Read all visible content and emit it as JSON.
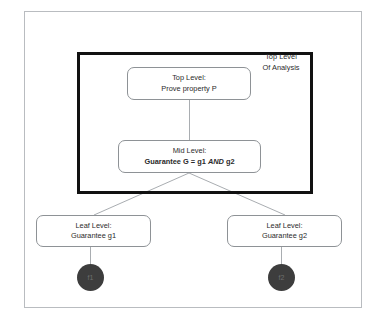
{
  "diagram": {
    "outer_frame": {
      "name": "assurance-case-outer-frame"
    },
    "inner_frame": {
      "caption_line1": "Top Level",
      "caption_line2": "Of Analysis"
    },
    "nodes": [
      {
        "id": "top",
        "line1": "Top Level:",
        "line2": "Prove property P"
      },
      {
        "id": "mid",
        "line1": "Mid Level:",
        "line2_prefix": "Guarantee G = g1 ",
        "line2_operator": "AND",
        "line2_suffix": " g2"
      },
      {
        "id": "leaf1",
        "line1": "Leaf Level:",
        "line2": "Guarantee g1"
      },
      {
        "id": "leaf2",
        "line1": "Leaf Level:",
        "line2": "Guarantee g2"
      }
    ],
    "terminals": [
      {
        "id": "f1",
        "label": "f1"
      },
      {
        "id": "f2",
        "label": "f2"
      }
    ],
    "colors": {
      "outer_border": "#b9bcc0",
      "inner_border": "#111111",
      "node_border": "#8e9296",
      "connector": "#a9adb1",
      "terminal_fill": "#3d3d3d",
      "text": "#2b2b2b",
      "background": "#ffffff"
    }
  }
}
